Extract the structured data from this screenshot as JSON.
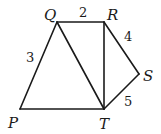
{
  "diagram": {
    "points": {
      "P": {
        "label": "P",
        "x": 20,
        "y": 109
      },
      "Q": {
        "label": "Q",
        "x": 57,
        "y": 22
      },
      "R": {
        "label": "R",
        "x": 104,
        "y": 22
      },
      "S": {
        "label": "S",
        "x": 139,
        "y": 74
      },
      "T": {
        "label": "T",
        "x": 104,
        "y": 109
      }
    },
    "segments": [
      {
        "from": "P",
        "to": "Q",
        "length_label": "3"
      },
      {
        "from": "Q",
        "to": "R",
        "length_label": "2"
      },
      {
        "from": "R",
        "to": "S",
        "length_label": "4"
      },
      {
        "from": "S",
        "to": "T",
        "length_label": "5"
      },
      {
        "from": "P",
        "to": "T",
        "length_label": ""
      },
      {
        "from": "Q",
        "to": "T",
        "length_label": ""
      },
      {
        "from": "R",
        "to": "T",
        "length_label": ""
      }
    ],
    "labels": {
      "P": "P",
      "Q": "Q",
      "R": "R",
      "S": "S",
      "T": "T",
      "len_PQ": "3",
      "len_QR": "2",
      "len_RS": "4",
      "len_ST": "5"
    }
  }
}
